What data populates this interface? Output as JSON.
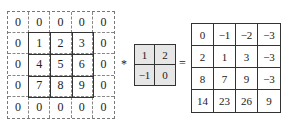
{
  "diagram": {
    "type": "2d-convolution",
    "input": {
      "label": "padded input",
      "rows": [
        [
          "0",
          "0",
          "0",
          "0",
          "0"
        ],
        [
          "0",
          "1",
          "2",
          "3",
          "0"
        ],
        [
          "0",
          "4",
          "5",
          "6",
          "0"
        ],
        [
          "0",
          "7",
          "8",
          "9",
          "0"
        ],
        [
          "0",
          "0",
          "0",
          "0",
          "0"
        ]
      ]
    },
    "operator_conv": "*",
    "kernel": {
      "rows": [
        [
          "1",
          "2"
        ],
        [
          "−1",
          "0"
        ]
      ],
      "fill": "#e6e6e6"
    },
    "operator_equals": "=",
    "output": {
      "rows": [
        [
          "0",
          "−1",
          "−2",
          "−3"
        ],
        [
          "2",
          "1",
          "3",
          "−3"
        ],
        [
          "8",
          "7",
          "9",
          "−3"
        ],
        [
          "14",
          "23",
          "26",
          "9"
        ]
      ]
    }
  }
}
